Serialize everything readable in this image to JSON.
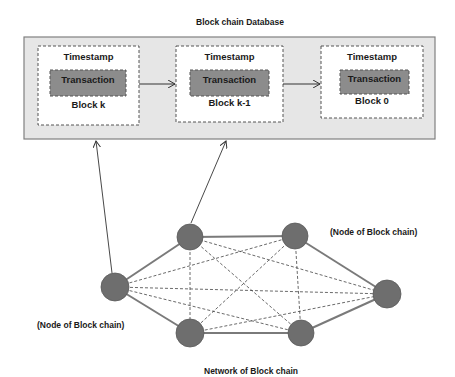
{
  "diagram": {
    "title": "Block chain Database",
    "network_label": "Network of Block chain",
    "node_label_right": "(Node of Block chain)",
    "node_label_left": "(Node of Block chain)",
    "blocks": [
      {
        "timestamp": "Timestamp",
        "transaction": "Transaction",
        "name": "Block k"
      },
      {
        "timestamp": "Timestamp",
        "transaction": "Transaction",
        "name": "Block k-1"
      },
      {
        "timestamp": "Timestamp",
        "transaction": "Transaction",
        "name": "Block 0"
      }
    ],
    "colors": {
      "database_bg": "#e6e6e6",
      "database_border": "#808080",
      "block_bg": "#ffffff",
      "transaction_bg": "#8c8c8c",
      "node_fill": "#6e6e6e",
      "edge": "#7a7a7a"
    }
  }
}
